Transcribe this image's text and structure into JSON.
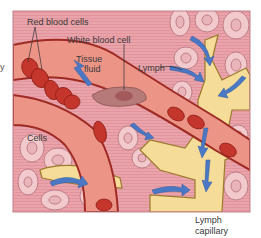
{
  "figure": {
    "colors": {
      "background": "#ffffff",
      "tissue": "#e9a3aa",
      "tissue_stripe": "#e08f98",
      "cell_fill": "#f2c9cc",
      "cell_outline": "#b3707a",
      "vessel_wall": "#9e2a24",
      "vessel_lumen": "#ec9486",
      "red_blood_cell": "#c4352b",
      "red_blood_cell_dark": "#8e1e18",
      "white_blood_cell": "#b67a78",
      "lymph": "#f5dc98",
      "lymph_outline": "#9b7a2c",
      "arrow": "#4a78c4",
      "frame": "#c08088"
    }
  },
  "labels": {
    "red_blood_cells": "Red blood cells",
    "white_blood_cell": "White blood cell",
    "tissue_fluid_line1": "Tissue",
    "tissue_fluid_line2": "fluid",
    "lymph": "Lymph",
    "cells": "Cells",
    "lymph_capillary_line1": "Lymph",
    "lymph_capillary_line2": "capillary",
    "edge_fragment": "y"
  },
  "icons": {
    "flow_arrow": "arrow-icon"
  }
}
